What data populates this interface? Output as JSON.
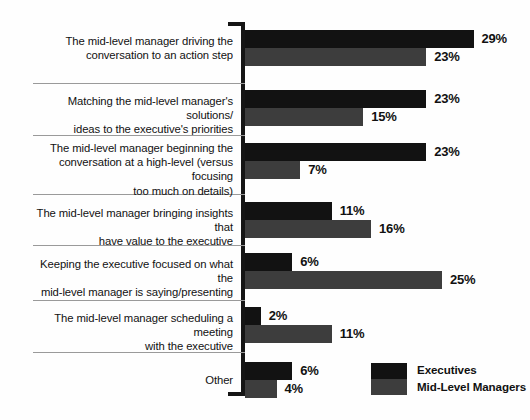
{
  "chart_data": {
    "type": "bar",
    "orientation": "horizontal",
    "title": "",
    "subtitle": "",
    "xlabel": "",
    "ylabel": "",
    "xlim": [
      0,
      29
    ],
    "grid": false,
    "value_suffix": "%",
    "legend_position": "bottom-right",
    "categories": [
      "The mid-level manager driving the conversation to an action step",
      "Matching the mid-level manager's solutions/ ideas to the executive's priorities",
      "The mid-level manager beginning the conversation at a high-level (versus focusing too much on details)",
      "The mid-level manager bringing insights that have value to the executive",
      "Keeping the executive focused on what the mid-level manager is saying/presenting",
      "The mid-level manager scheduling a meeting with the executive",
      "Other"
    ],
    "category_lines": [
      [
        "The mid-level manager driving the",
        "conversation to an action step"
      ],
      [
        "Matching the mid-level manager's solutions/",
        "ideas to the executive's priorities"
      ],
      [
        "The mid-level manager beginning the",
        "conversation at a high-level (versus focusing",
        "too much on details)"
      ],
      [
        "The mid-level manager bringing insights that",
        "have value to the executive"
      ],
      [
        "Keeping the executive focused on what the",
        "mid-level manager is saying/presenting"
      ],
      [
        "The mid-level manager scheduling a meeting",
        "with the executive"
      ],
      [
        "Other"
      ]
    ],
    "series": [
      {
        "name": "Executives",
        "color": "#121212",
        "values": [
          29,
          23,
          23,
          11,
          6,
          2,
          6
        ],
        "labels": [
          "29%",
          "23%",
          "23%",
          "11%",
          "6%",
          "2%",
          "6%"
        ]
      },
      {
        "name": "Mid-Level Managers",
        "color": "#3d3d3d",
        "values": [
          23,
          15,
          7,
          16,
          25,
          11,
          4
        ],
        "labels": [
          "23%",
          "15%",
          "7%",
          "16%",
          "25%",
          "11%",
          "4%"
        ]
      }
    ]
  },
  "legend": {
    "entries": [
      {
        "label": "Executives",
        "color": "#121212"
      },
      {
        "label": "Mid-Level Managers",
        "color": "#3d3d3d"
      }
    ]
  }
}
